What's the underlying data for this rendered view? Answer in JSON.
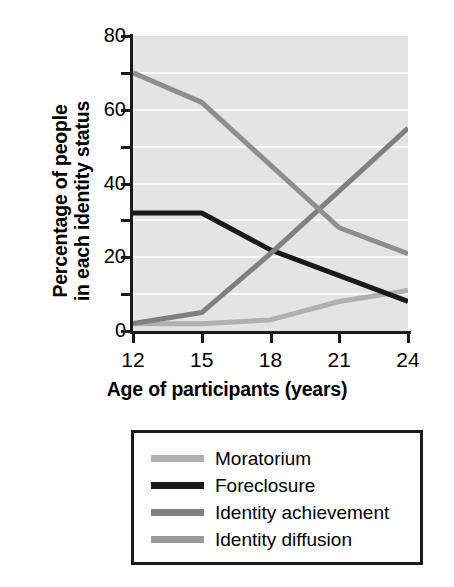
{
  "chart_data": {
    "type": "line",
    "title": "",
    "xlabel": "Age of participants (years)",
    "ylabel": "Percentage of people in each identity status",
    "ylabel_line1": "Percentage of people",
    "ylabel_line2": "in each identity status",
    "x": [
      12,
      15,
      18,
      21,
      24
    ],
    "xtick_labels": [
      "12",
      "15",
      "18",
      "21",
      "24"
    ],
    "xlim": [
      12,
      24
    ],
    "ylim": [
      0,
      80
    ],
    "ytick_labels": [
      "0",
      "20",
      "40",
      "60",
      "80"
    ],
    "yticks": [
      0,
      20,
      40,
      60,
      80
    ],
    "yminor_ticks": [
      10,
      30,
      50,
      70
    ],
    "grid": "horizontal-white-gridlines-every-10",
    "legend_position": "below-plot-boxed",
    "plot_background": "#e4e4e4",
    "series": [
      {
        "name": "Moratorium",
        "color": "#b0b0b0",
        "values": [
          2,
          2,
          3,
          8,
          11
        ]
      },
      {
        "name": "Foreclosure",
        "color": "#1a1a1a",
        "values": [
          32,
          32,
          22,
          15,
          8
        ]
      },
      {
        "name": "Identity achievement",
        "color": "#808080",
        "values": [
          2,
          5,
          21,
          38,
          55
        ]
      },
      {
        "name": "Identity diffusion",
        "color": "#8e8e8e",
        "values": [
          70,
          62,
          45,
          28,
          21
        ]
      }
    ]
  },
  "legend": {
    "items": [
      {
        "label": "Moratorium",
        "color": "#b0b0b0"
      },
      {
        "label": "Foreclosure",
        "color": "#1a1a1a"
      },
      {
        "label": "Identity achievement",
        "color": "#808080"
      },
      {
        "label": "Identity diffusion",
        "color": "#9a9a9a"
      }
    ]
  }
}
